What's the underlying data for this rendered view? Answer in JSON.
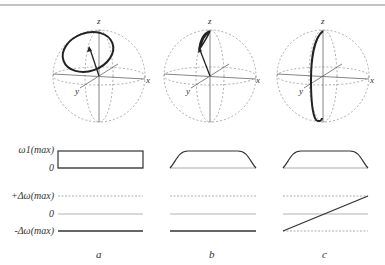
{
  "figure": {
    "panels": [
      {
        "id": "a",
        "label": "a",
        "axes": {
          "z": "z",
          "y": "y",
          "x": "x"
        },
        "omega1_profile": "rectangular",
        "delta_omega_profile": "constant at -Δω(max)"
      },
      {
        "id": "b",
        "label": "b",
        "axes": {
          "z": "z",
          "y": "y",
          "x": "x"
        },
        "omega1_profile": "smoothed trapezoid",
        "delta_omega_profile": "constant at -Δω(max)"
      },
      {
        "id": "c",
        "label": "c",
        "axes": {
          "z": "z",
          "y": "y",
          "x": "x"
        },
        "omega1_profile": "smoothed trapezoid",
        "delta_omega_profile": "linear sweep from -Δω(max) to +Δω(max)"
      }
    ],
    "row_labels": {
      "omega1_max": "ω1(max)",
      "omega1_zero": "0",
      "dw_plus": "+Δω(max)",
      "dw_zero": "0",
      "dw_minus": "-Δω(max)"
    }
  }
}
